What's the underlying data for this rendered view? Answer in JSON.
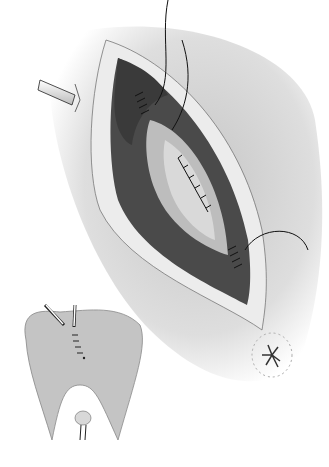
{
  "figure": {
    "type": "surgical-illustration",
    "colors": {
      "background": "#ffffff",
      "skin_shade": "#cfcfcf",
      "wound_edge": "#e8e8e8",
      "muscle": "#4a4a4a",
      "inner_layer": "#bdbdbd",
      "suture": "#111111",
      "inset_body": "#c4c4c4"
    },
    "elements": {
      "main_incision": "elliptical wound with layered closure",
      "drain_arrow": "tube arrow pointing right",
      "inset": "buttocks view with drains and sutures",
      "anus": "anal opening marking"
    }
  }
}
